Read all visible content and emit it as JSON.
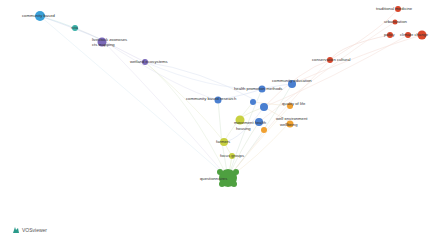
{
  "app": {
    "name": "VOSviewer"
  },
  "clusters": {
    "red": "#d9472b",
    "blue": "#4a7fd0",
    "orange": "#f0a030",
    "yellow": "#c8d040",
    "green": "#4ea040",
    "purple": "#7a68b8",
    "cyan": "#3aa0d8",
    "teal": "#3ab0a8"
  },
  "nodes": [
    {
      "label": "community based",
      "x": 40,
      "y": 16,
      "r": 5,
      "color": "cyan"
    },
    {
      "label": "rcta",
      "x": 75,
      "y": 28,
      "r": 3,
      "color": "teal"
    },
    {
      "label": "livestock zoonoses",
      "x": 102,
      "y": 40,
      "r": 4,
      "color": "purple"
    },
    {
      "label": "cts mapping",
      "x": 102,
      "y": 45,
      "r": 0,
      "color": "purple"
    },
    {
      "label": "wetland ecosystems",
      "x": 145,
      "y": 62,
      "r": 3,
      "color": "purple"
    },
    {
      "label": "traditional medicine",
      "x": 398,
      "y": 9,
      "r": 3,
      "color": "red"
    },
    {
      "label": "urbanization",
      "x": 395,
      "y": 22,
      "r": 2.5,
      "color": "red"
    },
    {
      "label": "policy",
      "x": 390,
      "y": 35,
      "r": 3,
      "color": "red"
    },
    {
      "label": "climate change",
      "x": 408,
      "y": 35,
      "r": 3,
      "color": "red"
    },
    {
      "label": "",
      "x": 422,
      "y": 35,
      "r": 4,
      "color": "red"
    },
    {
      "label": "conservation cultural",
      "x": 330,
      "y": 60,
      "r": 3,
      "color": "red"
    },
    {
      "label": "health promotion methods",
      "x": 262,
      "y": 89,
      "r": 3,
      "color": "blue"
    },
    {
      "label": "community health education",
      "x": 292,
      "y": 84,
      "r": 4,
      "color": "blue"
    },
    {
      "label": "community based research",
      "x": 218,
      "y": 100,
      "r": 3,
      "color": "blue"
    },
    {
      "label": "",
      "x": 253,
      "y": 102,
      "r": 3,
      "color": "blue"
    },
    {
      "label": "",
      "x": 264,
      "y": 107,
      "r": 4,
      "color": "blue"
    },
    {
      "label": "quality of life",
      "x": 290,
      "y": 106,
      "r": 3,
      "color": "orange"
    },
    {
      "label": "well environment wellbeing",
      "x": 290,
      "y": 122,
      "r": 3,
      "color": "orange"
    },
    {
      "label": "movement health",
      "x": 259,
      "y": 122,
      "r": 4,
      "color": "blue"
    },
    {
      "label": "",
      "x": 264,
      "y": 130,
      "r": 3,
      "color": "orange"
    },
    {
      "label": "",
      "x": 240,
      "y": 118,
      "r": 4,
      "color": "yellow"
    },
    {
      "label": "farmers",
      "x": 224,
      "y": 142,
      "r": 4,
      "color": "yellow"
    },
    {
      "label": "focus groups",
      "x": 232,
      "y": 156,
      "r": 3,
      "color": "yellow"
    },
    {
      "label": "questionnaires",
      "x": 228,
      "y": 178,
      "r": 9,
      "color": "green"
    }
  ],
  "labels_display": {
    "community_based": "community based",
    "rcta": "rcta",
    "livestock": "livestock zoonoses",
    "cts": "cts mapping",
    "wetland": "wetland ecosystems",
    "traditional": "traditional medicine",
    "urban": "urbanization",
    "policy": "policy",
    "climate": "climate change",
    "conservation": "conservation cultural",
    "health_promo": "health promotion methods",
    "community_edu": "community education",
    "community_research": "community based research",
    "quality": "quality of life",
    "wellbeing": "well environment",
    "wellbeing2": "wellbeing",
    "movement": "movement health",
    "movement2": "housing",
    "farmers": "farmers",
    "focus": "focus groups",
    "questionnaires": "questionnaires"
  }
}
